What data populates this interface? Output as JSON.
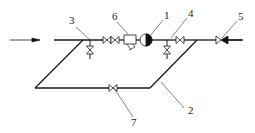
{
  "diagram": {
    "title": "",
    "flow_direction": "left-to-right",
    "labels": {
      "meter": "1",
      "bypass_pipe": "2",
      "inlet_valve": "3",
      "outlet_valve": "4",
      "check_valve": "5",
      "filter": "6",
      "bypass_valve": "7"
    },
    "components": [
      {
        "id": "1",
        "name": "meter",
        "symbol": "half-filled-circle"
      },
      {
        "id": "2",
        "name": "bypass pipe",
        "symbol": "line"
      },
      {
        "id": "3",
        "name": "inlet valve with drain",
        "symbol": "gate-valve"
      },
      {
        "id": "4",
        "name": "outlet valve with drain",
        "symbol": "gate-valve"
      },
      {
        "id": "5",
        "name": "check valve",
        "symbol": "check-valve"
      },
      {
        "id": "6",
        "name": "filter / strainer",
        "symbol": "y-strainer"
      },
      {
        "id": "7",
        "name": "bypass valve",
        "symbol": "gate-valve"
      }
    ]
  }
}
